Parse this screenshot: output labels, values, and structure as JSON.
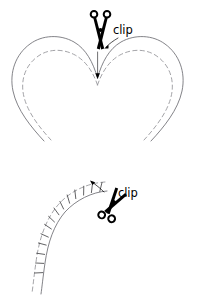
{
  "page": {
    "background_color": "#ffffff",
    "width": 197,
    "height": 297
  },
  "colors": {
    "cut_line": "#6d6d72",
    "seam_line": "#8b8b90",
    "notch_line": "#3a3a3c",
    "scissors": "#000000",
    "label_text": "#000000",
    "background": "#ffffff"
  },
  "diagrams": [
    {
      "id": "heart-inner-corner",
      "name": "heart-clip-diagram",
      "description": "Heart shape with solid cutting line and dashed stitching line; scissors clip into the inner V corner",
      "label": {
        "text": "clip",
        "x": 114,
        "y": 33
      },
      "scissors": {
        "name": "scissors-icon-top",
        "rotation_deg": 0,
        "center_x": 103,
        "center_y": 30
      },
      "lines": {
        "outer": "solid",
        "inner": "dashed"
      },
      "clip_slit": {
        "from_y": 52,
        "to_y": 76
      }
    },
    {
      "id": "curved-seam-notches",
      "name": "curve-notch-clip-diagram",
      "description": "Curved seam allowance band with wedge notches cut along the outer edge; scissors clip a notch",
      "label": {
        "text": "clip",
        "x": 118,
        "y": 196
      },
      "scissors": {
        "name": "scissors-icon-bottom",
        "rotation_deg": 34,
        "center_x": 112,
        "center_y": 205
      },
      "lines": {
        "outer": "solid",
        "inner": "dashed"
      },
      "notch_count": 7
    }
  ]
}
